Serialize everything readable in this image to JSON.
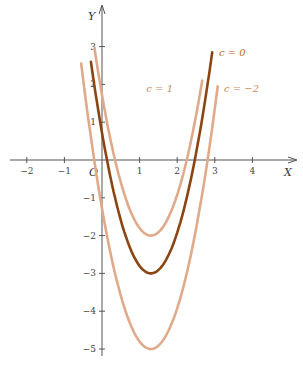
{
  "chart_data": {
    "type": "line",
    "title": "",
    "xlabel": "X",
    "ylabel": "Y",
    "origin_label": "O",
    "xlim": [
      -2.5,
      5
    ],
    "ylim": [
      -5.2,
      3.5
    ],
    "x_ticks": [
      "-2",
      "-1",
      "1",
      "2",
      "3",
      "4"
    ],
    "y_ticks": [
      "3",
      "2",
      "1",
      "-1",
      "-2",
      "-3",
      "-4",
      "-5"
    ],
    "grid": false,
    "series": [
      {
        "name": "c = 0",
        "c": 0,
        "vertex": [
          1.3,
          -3
        ],
        "color": "#8b4513",
        "label_pos": [
          2.95,
          2.9
        ]
      },
      {
        "name": "c = 1",
        "c": 1,
        "vertex": [
          1.3,
          -2
        ],
        "color": "#e0aa8a",
        "label_pos": [
          2.55,
          1.9
        ]
      },
      {
        "name": "c = −2",
        "c": -2,
        "vertex": [
          1.3,
          -5
        ],
        "color": "#e0aa8a",
        "label_pos": [
          3.1,
          1.9
        ]
      }
    ]
  }
}
